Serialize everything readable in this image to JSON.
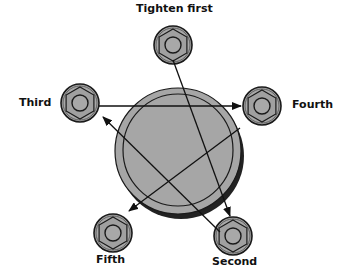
{
  "colors": {
    "bolt_fill": "#a8a8a8",
    "bolt_outline": "#1a1a1a",
    "disk_fill": "#a6a6a6",
    "arrow": "#111111",
    "label": "#111111"
  },
  "bolts": [
    {
      "id": "first",
      "label": "Tighten first",
      "order": 1,
      "cx": 173,
      "cy": 45
    },
    {
      "id": "second",
      "label": "Second",
      "order": 2,
      "cx": 233,
      "cy": 236
    },
    {
      "id": "third",
      "label": "Third",
      "order": 3,
      "cx": 80,
      "cy": 103
    },
    {
      "id": "fourth",
      "label": "Fourth",
      "order": 4,
      "cx": 262,
      "cy": 106
    },
    {
      "id": "fifth",
      "label": "Fifth",
      "order": 5,
      "cx": 113,
      "cy": 233
    }
  ],
  "arrows": [
    {
      "from": "first",
      "to": "second"
    },
    {
      "from": "second",
      "to": "third"
    },
    {
      "from": "third",
      "to": "fourth"
    },
    {
      "from": "fourth",
      "to": "fifth"
    }
  ]
}
